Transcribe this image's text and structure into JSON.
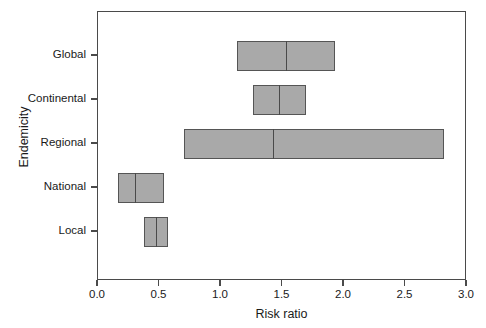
{
  "chart_data": {
    "type": "bar",
    "chart_style": "horizontal-range-bars-with-median",
    "title": "",
    "xlabel": "Risk ratio",
    "ylabel": "Endemicity",
    "xlim": [
      0.0,
      3.0
    ],
    "xticks": [
      0.0,
      0.5,
      1.0,
      1.5,
      2.0,
      2.5,
      3.0
    ],
    "xtick_labels": [
      "0.0",
      "0.5",
      "1.0",
      "1.5",
      "2.0",
      "2.5",
      "3.0"
    ],
    "categories": [
      "Global",
      "Continental",
      "Regional",
      "National",
      "Local"
    ],
    "grid": false,
    "legend": null,
    "bar_fill_color": "#a9a9a9",
    "bar_edge_color": "#555555",
    "axis_color": "#4a4a4a",
    "background_color": "#ffffff",
    "bars": [
      {
        "category": "Global",
        "low": 1.13,
        "median": 1.53,
        "high": 1.93
      },
      {
        "category": "Continental",
        "low": 1.26,
        "median": 1.47,
        "high": 1.69
      },
      {
        "category": "Regional",
        "low": 0.7,
        "median": 1.42,
        "high": 2.81
      },
      {
        "category": "National",
        "low": 0.16,
        "median": 0.3,
        "high": 0.54
      },
      {
        "category": "Local",
        "low": 0.37,
        "median": 0.47,
        "high": 0.57
      }
    ]
  }
}
